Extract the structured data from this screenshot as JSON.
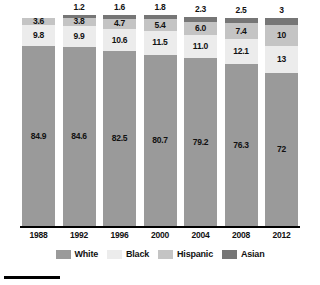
{
  "chart_data": {
    "type": "bar",
    "subtype": "stacked-bar-100",
    "title": "",
    "subtitle": "",
    "xlabel": "",
    "ylabel": "",
    "ylim": [
      0,
      100
    ],
    "grid": false,
    "legend_position": "bottom",
    "stack_order_bottom_to_top": [
      "White",
      "Black",
      "Hispanic",
      "Asian"
    ],
    "categories": [
      "1988",
      "1992",
      "1996",
      "2000",
      "2004",
      "2008",
      "2012"
    ],
    "series": [
      {
        "name": "White",
        "color": "#9a9a9a",
        "values": [
          84.9,
          84.6,
          82.5,
          80.7,
          79.2,
          76.3,
          72
        ]
      },
      {
        "name": "Black",
        "color": "#ececec",
        "values": [
          9.8,
          9.9,
          10.6,
          11.5,
          11.0,
          12.1,
          13
        ]
      },
      {
        "name": "Hispanic",
        "color": "#c4c4c4",
        "values": [
          3.6,
          3.8,
          4.7,
          5.4,
          6.0,
          7.4,
          10
        ]
      },
      {
        "name": "Asian",
        "color": "#767676",
        "values": [
          null,
          1.2,
          1.6,
          1.8,
          2.3,
          2.5,
          3
        ]
      }
    ],
    "value_labels": {
      "White": [
        "84.9",
        "84.6",
        "82.5",
        "80.7",
        "79.2",
        "76.3",
        "72"
      ],
      "Black": [
        "9.8",
        "9.9",
        "10.6",
        "11.5",
        "11.0",
        "12.1",
        "13"
      ],
      "Hispanic": [
        "3.6",
        "3.8",
        "4.7",
        "5.4",
        "6.0",
        "7.4",
        "10"
      ],
      "Asian": [
        "",
        "1.2",
        "1.6",
        "1.8",
        "2.3",
        "2.5",
        "3"
      ]
    }
  },
  "legend": {
    "items": [
      {
        "label": "White",
        "color": "#9a9a9a"
      },
      {
        "label": "Black",
        "color": "#ececec"
      },
      {
        "label": "Hispanic",
        "color": "#c4c4c4"
      },
      {
        "label": "Asian",
        "color": "#767676"
      }
    ]
  },
  "axis": {
    "ticks": [
      "1988",
      "1992",
      "1996",
      "2000",
      "2004",
      "2008",
      "2012"
    ]
  },
  "colors": {
    "white_series": "#9a9a9a",
    "black_series": "#ececec",
    "hispanic_series": "#c4c4c4",
    "asian_series": "#767676",
    "axis": "#000000",
    "label_text": "#111111",
    "background": "#ffffff"
  }
}
